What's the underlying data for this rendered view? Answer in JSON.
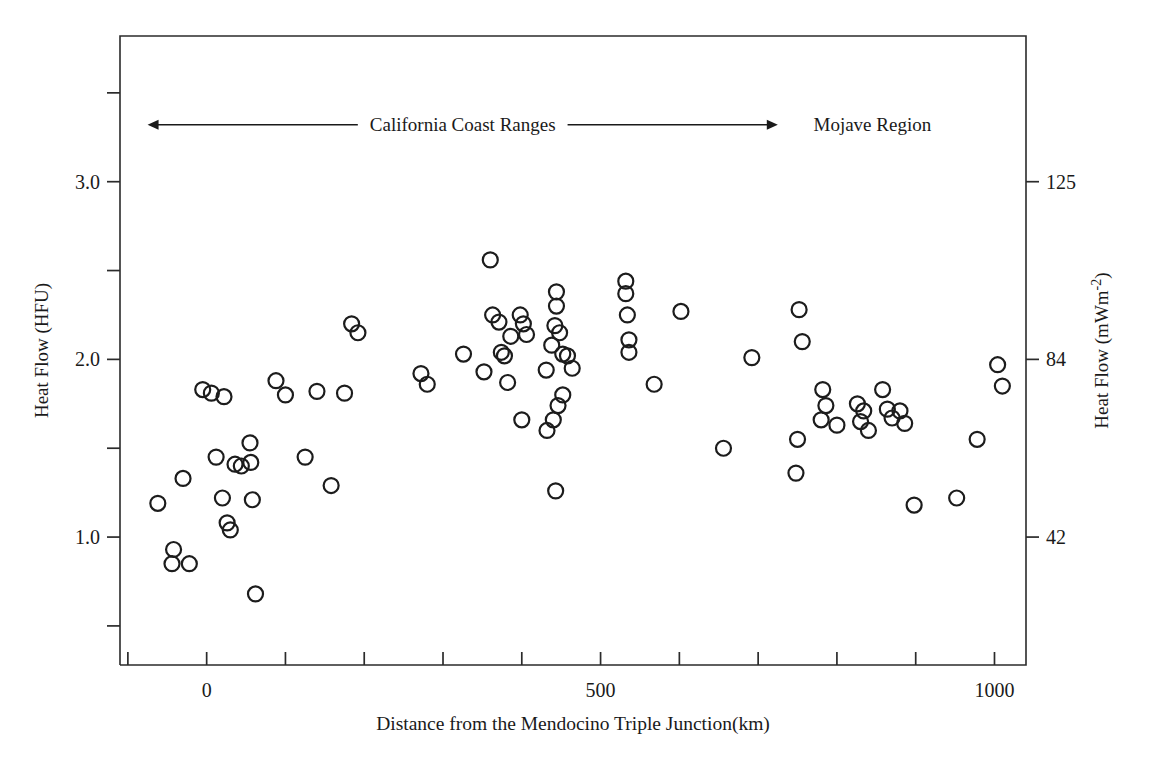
{
  "chart_data": {
    "type": "scatter",
    "title": "",
    "xlabel": "Distance from the Mendocino Triple Junction(km)",
    "ylabel": "Heat Flow (HFU)",
    "ylabel_right": "Heat Flow (mWm-2)",
    "ylabel_right_base": "Heat Flow (mWm",
    "ylabel_right_exp": "-2",
    "ylabel_right_close": ")",
    "xlim": [
      -110,
      1040
    ],
    "ylim": [
      0.28,
      3.82
    ],
    "grid": false,
    "legend": null,
    "xticks": [
      -100,
      0,
      100,
      200,
      300,
      400,
      500,
      600,
      700,
      800,
      900,
      1000
    ],
    "xtick_labels": [
      {
        "value": 0,
        "label": "0"
      },
      {
        "value": 500,
        "label": "500"
      },
      {
        "value": 1000,
        "label": "1000"
      }
    ],
    "yticks_left": [
      0.5,
      1.0,
      1.5,
      2.0,
      2.5,
      3.0,
      3.5
    ],
    "ytick_labels_left": [
      {
        "value": 1.0,
        "label": "1.0"
      },
      {
        "value": 2.0,
        "label": "2.0"
      },
      {
        "value": 3.0,
        "label": "3.0"
      }
    ],
    "yticks_right": [
      {
        "value": 1.0,
        "label": "42"
      },
      {
        "value": 2.0,
        "label": "84"
      },
      {
        "value": 3.0,
        "label": "125"
      }
    ],
    "annotations": [
      {
        "name": "california-coast-ranges",
        "text": "California Coast Ranges",
        "x_start": -75,
        "x_end": 725,
        "y": 3.32
      },
      {
        "name": "mojave-region",
        "text": "Mojave Region",
        "x": 845,
        "y": 3.32
      }
    ],
    "marker": {
      "shape": "open-circle",
      "size": 9,
      "stroke": "#1c1c1c",
      "fill": "none"
    },
    "points": [
      {
        "x": -62,
        "y": 1.19
      },
      {
        "x": -42,
        "y": 0.93
      },
      {
        "x": -44,
        "y": 0.85
      },
      {
        "x": -22,
        "y": 0.85
      },
      {
        "x": -30,
        "y": 1.33
      },
      {
        "x": -5,
        "y": 1.83
      },
      {
        "x": 6,
        "y": 1.81
      },
      {
        "x": 12,
        "y": 1.45
      },
      {
        "x": 22,
        "y": 1.79
      },
      {
        "x": 20,
        "y": 1.22
      },
      {
        "x": 26,
        "y": 1.08
      },
      {
        "x": 30,
        "y": 1.04
      },
      {
        "x": 36,
        "y": 1.41
      },
      {
        "x": 44,
        "y": 1.4
      },
      {
        "x": 55,
        "y": 1.53
      },
      {
        "x": 56,
        "y": 1.42
      },
      {
        "x": 58,
        "y": 1.21
      },
      {
        "x": 62,
        "y": 0.68
      },
      {
        "x": 88,
        "y": 1.88
      },
      {
        "x": 100,
        "y": 1.8
      },
      {
        "x": 125,
        "y": 1.45
      },
      {
        "x": 140,
        "y": 1.82
      },
      {
        "x": 158,
        "y": 1.29
      },
      {
        "x": 175,
        "y": 1.81
      },
      {
        "x": 184,
        "y": 2.2
      },
      {
        "x": 192,
        "y": 2.15
      },
      {
        "x": 272,
        "y": 1.92
      },
      {
        "x": 280,
        "y": 1.86
      },
      {
        "x": 326,
        "y": 2.03
      },
      {
        "x": 352,
        "y": 1.93
      },
      {
        "x": 360,
        "y": 2.56
      },
      {
        "x": 363,
        "y": 2.25
      },
      {
        "x": 371,
        "y": 2.21
      },
      {
        "x": 374,
        "y": 2.04
      },
      {
        "x": 378,
        "y": 2.02
      },
      {
        "x": 386,
        "y": 2.13
      },
      {
        "x": 382,
        "y": 1.87
      },
      {
        "x": 398,
        "y": 2.25
      },
      {
        "x": 402,
        "y": 2.2
      },
      {
        "x": 406,
        "y": 2.14
      },
      {
        "x": 400,
        "y": 1.66
      },
      {
        "x": 444,
        "y": 2.38
      },
      {
        "x": 444,
        "y": 2.3
      },
      {
        "x": 442,
        "y": 2.19
      },
      {
        "x": 448,
        "y": 2.15
      },
      {
        "x": 438,
        "y": 2.08
      },
      {
        "x": 452,
        "y": 2.03
      },
      {
        "x": 458,
        "y": 2.02
      },
      {
        "x": 431,
        "y": 1.94
      },
      {
        "x": 452,
        "y": 1.8
      },
      {
        "x": 446,
        "y": 1.74
      },
      {
        "x": 440,
        "y": 1.66
      },
      {
        "x": 432,
        "y": 1.6
      },
      {
        "x": 443,
        "y": 1.26
      },
      {
        "x": 464,
        "y": 1.95
      },
      {
        "x": 532,
        "y": 2.44
      },
      {
        "x": 532,
        "y": 2.37
      },
      {
        "x": 534,
        "y": 2.25
      },
      {
        "x": 536,
        "y": 2.11
      },
      {
        "x": 536,
        "y": 2.04
      },
      {
        "x": 568,
        "y": 1.86
      },
      {
        "x": 602,
        "y": 2.27
      },
      {
        "x": 656,
        "y": 1.5
      },
      {
        "x": 692,
        "y": 2.01
      },
      {
        "x": 752,
        "y": 2.28
      },
      {
        "x": 756,
        "y": 2.1
      },
      {
        "x": 750,
        "y": 1.55
      },
      {
        "x": 748,
        "y": 1.36
      },
      {
        "x": 782,
        "y": 1.83
      },
      {
        "x": 786,
        "y": 1.74
      },
      {
        "x": 780,
        "y": 1.66
      },
      {
        "x": 800,
        "y": 1.63
      },
      {
        "x": 826,
        "y": 1.75
      },
      {
        "x": 834,
        "y": 1.71
      },
      {
        "x": 830,
        "y": 1.65
      },
      {
        "x": 840,
        "y": 1.6
      },
      {
        "x": 858,
        "y": 1.83
      },
      {
        "x": 864,
        "y": 1.72
      },
      {
        "x": 870,
        "y": 1.67
      },
      {
        "x": 880,
        "y": 1.71
      },
      {
        "x": 886,
        "y": 1.64
      },
      {
        "x": 898,
        "y": 1.18
      },
      {
        "x": 952,
        "y": 1.22
      },
      {
        "x": 978,
        "y": 1.55
      },
      {
        "x": 1004,
        "y": 1.97
      },
      {
        "x": 1010,
        "y": 1.85
      }
    ]
  }
}
